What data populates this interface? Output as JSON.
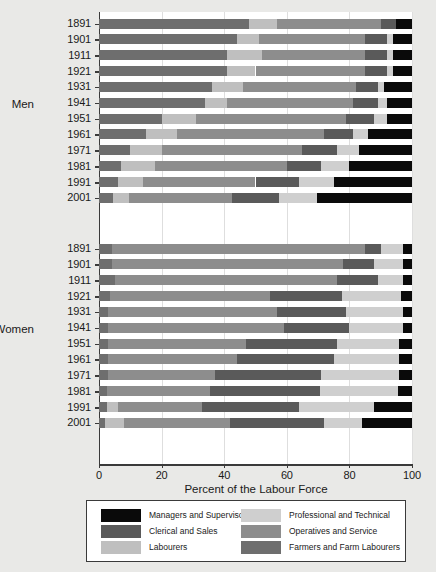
{
  "chart_data": {
    "type": "bar",
    "subtype": "horizontal-stacked-percent",
    "title": "",
    "xlabel": "Percent of the Labour Force",
    "ylabel": "",
    "xlim": [
      0,
      100
    ],
    "xticks": [
      0,
      20,
      40,
      60,
      80,
      100
    ],
    "xticklabels": [
      "0",
      "20",
      "40",
      "60",
      "80",
      "100"
    ],
    "grid": "vertical",
    "legend_position": "bottom",
    "groups": [
      "Men",
      "Women"
    ],
    "categories": [
      "1891",
      "1901",
      "1911",
      "1921",
      "1931",
      "1941",
      "1951",
      "1961",
      "1971",
      "1981",
      "1991",
      "2001"
    ],
    "series": [
      {
        "name": "Farmers and Farm Labourers",
        "color": "#6e6e6e",
        "men": [
          48.0,
          44.0,
          41.0,
          41.0,
          36.0,
          34.0,
          20.0,
          15.0,
          10.0,
          7.0,
          6.0,
          4.5
        ],
        "women": [
          4.0,
          4.0,
          5.0,
          3.5,
          3.0,
          3.0,
          3.0,
          3.0,
          3.0,
          2.5,
          2.5,
          2.0
        ]
      },
      {
        "name": "Labourers",
        "color": "#bfbfbf",
        "men": [
          9.0,
          7.0,
          11.0,
          9.0,
          10.0,
          7.0,
          11.0,
          10.0,
          10.0,
          11.0,
          8.0,
          5.0
        ],
        "women": [
          0.0,
          0.0,
          0.0,
          0.0,
          0.0,
          0.0,
          0.0,
          0.0,
          0.0,
          0.0,
          3.5,
          6.0
        ]
      },
      {
        "name": "Operatives and Service",
        "color": "#8d8d8d",
        "men": [
          33.0,
          34.0,
          33.0,
          35.0,
          36.0,
          40.0,
          48.0,
          47.0,
          45.0,
          42.0,
          36.0,
          33.0
        ],
        "women": [
          81.0,
          74.0,
          71.0,
          51.0,
          54.0,
          56.0,
          44.0,
          41.0,
          34.0,
          33.0,
          27.0,
          34.0
        ]
      },
      {
        "name": "Clerical and Sales",
        "color": "#5a5a5a",
        "men": [
          5.0,
          7.0,
          7.0,
          7.0,
          7.0,
          8.0,
          9.0,
          9.0,
          11.0,
          11.0,
          14.0,
          15.0
        ],
        "women": [
          5.0,
          10.0,
          13.0,
          23.0,
          22.0,
          21.0,
          29.0,
          31.0,
          34.0,
          35.0,
          31.0,
          30.0
        ]
      },
      {
        "name": "Professional and Technical",
        "color": "#cfcfcf",
        "men": [
          0.0,
          2.0,
          2.0,
          2.0,
          2.0,
          3.0,
          4.0,
          5.0,
          7.0,
          9.0,
          11.0,
          12.0
        ],
        "women": [
          7.0,
          9.0,
          8.0,
          19.0,
          18.0,
          17.0,
          20.0,
          21.0,
          25.0,
          25.0,
          24.0,
          12.0
        ]
      },
      {
        "name": "Managers and Supervisors",
        "color": "#0a0a0a",
        "men": [
          5.0,
          6.0,
          6.0,
          6.0,
          9.0,
          8.0,
          8.0,
          14.0,
          17.0,
          20.0,
          25.0,
          30.5
        ],
        "women": [
          3.0,
          3.0,
          3.0,
          3.5,
          3.0,
          3.0,
          4.0,
          4.0,
          4.0,
          4.5,
          12.0,
          16.0
        ]
      }
    ]
  },
  "legend": {
    "entries": [
      {
        "label": "Managers and Supervisors",
        "color": "#0a0a0a"
      },
      {
        "label": "Professional and Technical",
        "color": "#cfcfcf"
      },
      {
        "label": "Clerical and Sales",
        "color": "#5a5a5a"
      },
      {
        "label": "Operatives and Service",
        "color": "#8d8d8d"
      },
      {
        "label": "Labourers",
        "color": "#bfbfbf"
      },
      {
        "label": "Farmers and Farm Labourers",
        "color": "#6e6e6e"
      }
    ]
  },
  "colors": {
    "background": "#e9e9e7",
    "plot_background": "#ffffff",
    "axis": "#3a3a3a",
    "gridline": "#dedede",
    "text": "#1a1a1a"
  }
}
